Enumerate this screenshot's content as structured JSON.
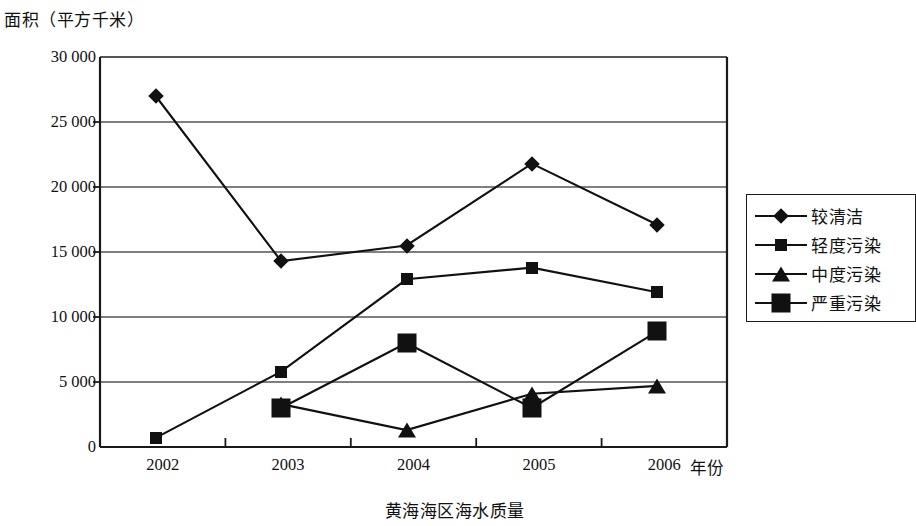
{
  "chart_data": {
    "type": "line",
    "title": "黄海海区海水质量",
    "xlabel": "年份",
    "ylabel": "面积（平方千米）",
    "categories": [
      "2002",
      "2003",
      "2004",
      "2005",
      "2006"
    ],
    "ylim": [
      0,
      30000
    ],
    "yticks": [
      "0",
      "5 000",
      "10 000",
      "15 000",
      "20 000",
      "25 000",
      "30 000"
    ],
    "ytick_values": [
      0,
      5000,
      10000,
      15000,
      20000,
      25000,
      30000
    ],
    "grid": true,
    "legend_position": "right",
    "series": [
      {
        "name": "较清洁",
        "marker": "diamond",
        "values": [
          27000,
          14300,
          15500,
          21800,
          17100
        ]
      },
      {
        "name": "轻度污染",
        "marker": "square-small",
        "values": [
          700,
          5800,
          12900,
          13800,
          11900
        ]
      },
      {
        "name": "中度污染",
        "marker": "triangle",
        "values": [
          null,
          3300,
          1300,
          4100,
          4700
        ]
      },
      {
        "name": "严重污染",
        "marker": "square-large",
        "values": [
          null,
          3000,
          8000,
          3000,
          8900
        ]
      }
    ]
  },
  "colors": {
    "ink": "#111111",
    "grid": "#555555",
    "axis": "#1a1a1a",
    "background": "#ffffff"
  },
  "legend": {
    "items": [
      {
        "label": "较清洁",
        "marker": "diamond"
      },
      {
        "label": "轻度污染",
        "marker": "square-small"
      },
      {
        "label": "中度污染",
        "marker": "triangle"
      },
      {
        "label": "严重污染",
        "marker": "square-large"
      }
    ]
  }
}
